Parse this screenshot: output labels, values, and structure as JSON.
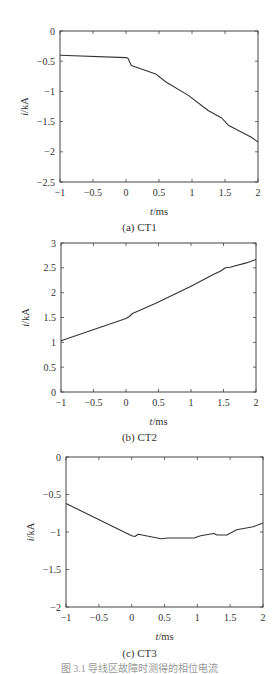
{
  "chart_data": [
    {
      "type": "line",
      "title": "",
      "caption": "(a) CT1",
      "xlabel": "t/ms",
      "ylabel": "i/kA",
      "xlim": [
        -1,
        2
      ],
      "ylim": [
        -2.5,
        0
      ],
      "xticks": [
        -1,
        -0.5,
        0,
        0.5,
        1,
        1.5,
        2
      ],
      "xtick_labels": [
        "−1",
        "−0.5",
        "0",
        "0.5",
        "1",
        "1.5",
        "2"
      ],
      "yticks": [
        0,
        -0.5,
        -1,
        -1.5,
        -2,
        -2.5
      ],
      "ytick_labels": [
        "0",
        "−0.5",
        "−1",
        "−1.5",
        "−2",
        "−2.5"
      ],
      "grid": false,
      "series": [
        {
          "name": "CT1",
          "x": [
            -1,
            0,
            0.03,
            0.08,
            0.45,
            0.6,
            0.95,
            1.25,
            1.45,
            1.55,
            1.9,
            2
          ],
          "y": [
            -0.4,
            -0.44,
            -0.45,
            -0.57,
            -0.71,
            -0.84,
            -1.07,
            -1.32,
            -1.44,
            -1.56,
            -1.76,
            -1.84
          ]
        }
      ]
    },
    {
      "type": "line",
      "title": "",
      "caption": "(b) CT2",
      "xlabel": "t/ms",
      "ylabel": "i/kA",
      "xlim": [
        -1,
        2
      ],
      "ylim": [
        0,
        3
      ],
      "xticks": [
        -1,
        -0.5,
        0,
        0.5,
        1,
        1.5,
        2
      ],
      "xtick_labels": [
        "−1",
        "−0.5",
        "0",
        "0.5",
        "1",
        "1.5",
        "2"
      ],
      "yticks": [
        3,
        2.5,
        2,
        1.5,
        1,
        0.5,
        0
      ],
      "ytick_labels": [
        "3",
        "2.5",
        "2",
        "1.5",
        "1",
        "0.5",
        "0"
      ],
      "grid": false,
      "series": [
        {
          "name": "CT2",
          "x": [
            -1,
            0,
            0.05,
            0.1,
            0.45,
            1,
            1.35,
            1.45,
            1.53,
            1.6,
            1.85,
            2
          ],
          "y": [
            1.03,
            1.48,
            1.52,
            1.58,
            1.78,
            2.13,
            2.37,
            2.43,
            2.5,
            2.51,
            2.6,
            2.67
          ]
        }
      ]
    },
    {
      "type": "line",
      "title": "",
      "caption": "(c) CT3",
      "xlabel": "t/ms",
      "ylabel": "i/kA",
      "xlim": [
        -1,
        2
      ],
      "ylim": [
        -2,
        0
      ],
      "xticks": [
        -1,
        -0.5,
        0,
        0.5,
        1,
        1.5,
        2
      ],
      "xtick_labels": [
        "−1",
        "−0.5",
        "0",
        "0.5",
        "1",
        "1.5",
        "2"
      ],
      "yticks": [
        0,
        -0.5,
        -1,
        -1.5,
        -2
      ],
      "ytick_labels": [
        "0",
        "−0.5",
        "−1",
        "−1.5",
        "−2"
      ],
      "grid": false,
      "series": [
        {
          "name": "CT3",
          "x": [
            -1,
            0,
            0.05,
            0.1,
            0.45,
            0.55,
            0.95,
            1.05,
            1.25,
            1.3,
            1.45,
            1.6,
            1.85,
            2
          ],
          "y": [
            -0.62,
            -1.05,
            -1.06,
            -1.03,
            -1.09,
            -1.08,
            -1.08,
            -1.05,
            -1.02,
            -1.04,
            -1.04,
            -0.97,
            -0.93,
            -0.88
          ]
        }
      ]
    }
  ],
  "layout": {
    "panels": [
      {
        "left": 60,
        "right": 258,
        "top": 31,
        "bottom": 182
      },
      {
        "left": 61,
        "right": 256,
        "top": 243,
        "bottom": 392
      },
      {
        "left": 66,
        "right": 263,
        "top": 457,
        "bottom": 607
      }
    ]
  },
  "labels": {
    "xlabel_t": "t",
    "xlabel_unit": "/ms",
    "ylabel_i": "i",
    "ylabel_unit": "/kA",
    "captions": [
      "(a) CT1",
      "(b) CT2",
      "(c) CT3"
    ],
    "figure_caption": "图 3.1   导线区故障时测得的相位电流"
  },
  "colors": {
    "line": "#333333",
    "axis": "#444444",
    "text": "#333333"
  }
}
